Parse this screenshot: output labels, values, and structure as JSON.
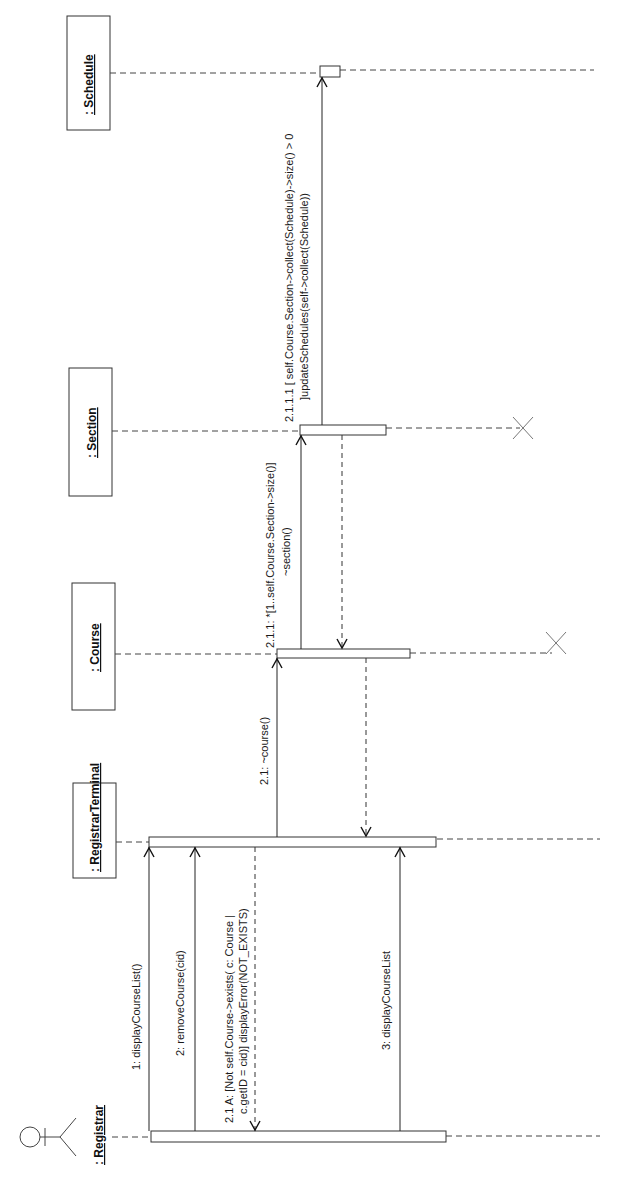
{
  "diagram": {
    "type": "UML sequence diagram (rotated 90° counter-clockwise)",
    "actor": {
      "label": ": Registrar",
      "icon": "stick-figure-actor-icon"
    },
    "objects": [
      {
        "id": "registrar_terminal",
        "label": ": RegistrarTerminal"
      },
      {
        "id": "course",
        "label": ": Course"
      },
      {
        "id": "section",
        "label": ": Section"
      },
      {
        "id": "schedule",
        "label": ": Schedule"
      }
    ],
    "messages": [
      {
        "id": "m1",
        "label": "1: displayCourseList()",
        "from": "registrar",
        "to": "registrar_terminal",
        "kind": "call"
      },
      {
        "id": "m2",
        "label": "2: removeCourse(cid)",
        "from": "registrar",
        "to": "registrar_terminal",
        "kind": "call"
      },
      {
        "id": "m21a_line1",
        "label": "2.1 A: [Not self.Course->exists( c: Course |",
        "from": "registrar_terminal",
        "to": "registrar",
        "kind": "return"
      },
      {
        "id": "m21a_line2",
        "label": "c.getID = cid)] displayError(NOT_EXISTS)"
      },
      {
        "id": "m21",
        "label": "2.1: ~course()",
        "from": "registrar_terminal",
        "to": "course",
        "kind": "call"
      },
      {
        "id": "m211_line1",
        "label": "2.1.1: *[1..self.Course.Section->size()]",
        "from": "course",
        "to": "section",
        "kind": "call"
      },
      {
        "id": "m211_line2",
        "label": "~section()"
      },
      {
        "id": "m2111_line1",
        "label": "2.1.1.1 [ self.Course.Section->collect(Schedule)->size() > 0",
        "from": "section",
        "to": "schedule",
        "kind": "call"
      },
      {
        "id": "m2111_line2",
        "label": "]updateSchedules(self->collect(Schedule))"
      },
      {
        "id": "m3",
        "label": "3: displayCourseList",
        "from": "registrar",
        "to": "registrar_terminal",
        "kind": "call"
      }
    ],
    "destroyed": [
      "course",
      "section"
    ]
  }
}
